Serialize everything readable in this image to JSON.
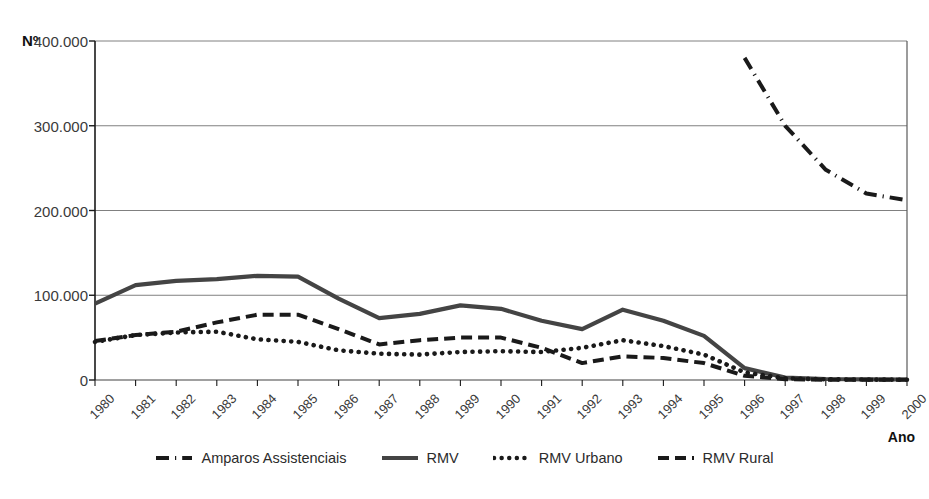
{
  "chart_data": {
    "type": "line",
    "title": "",
    "xlabel": "Ano",
    "ylabel": "Nº",
    "ylim": [
      0,
      400000
    ],
    "yticks": [
      0,
      100000,
      200000,
      300000,
      400000
    ],
    "ytick_labels": [
      "0",
      "100.000",
      "200.000",
      "300.000",
      "400.000"
    ],
    "grid": true,
    "legend_position": "bottom",
    "categories": [
      "1980",
      "1981",
      "1982",
      "1983",
      "1984",
      "1985",
      "1986",
      "1987",
      "1988",
      "1989",
      "1990",
      "1991",
      "1992",
      "1993",
      "1994",
      "1995",
      "1996",
      "1997",
      "1998",
      "1999",
      "2000"
    ],
    "series": [
      {
        "name": "Amparos Assistenciais",
        "style": "dash-dot",
        "color": "#1a1a1a",
        "values": [
          null,
          null,
          null,
          null,
          null,
          null,
          null,
          null,
          null,
          null,
          null,
          null,
          null,
          null,
          null,
          null,
          380000,
          300000,
          248000,
          220000,
          212000
        ]
      },
      {
        "name": "RMV",
        "style": "solid",
        "color": "#444444",
        "values": [
          90000,
          112000,
          117000,
          119000,
          123000,
          122000,
          96000,
          73000,
          78000,
          88000,
          84000,
          70000,
          60000,
          83000,
          70000,
          52000,
          14000,
          3000,
          1200,
          800,
          600
        ]
      },
      {
        "name": "RMV Urbano",
        "style": "dotted",
        "color": "#1a1a1a",
        "values": [
          45000,
          53000,
          56000,
          57000,
          48000,
          45000,
          35000,
          31000,
          30000,
          33000,
          34000,
          33000,
          38000,
          47000,
          40000,
          30000,
          9000,
          2000,
          800,
          500,
          400
        ]
      },
      {
        "name": "RMV Rural",
        "style": "dashed",
        "color": "#1a1a1a",
        "values": [
          46000,
          53000,
          57000,
          68000,
          77000,
          77000,
          60000,
          42000,
          47000,
          50000,
          50000,
          38000,
          20000,
          28000,
          26000,
          20000,
          5000,
          1000,
          400,
          300,
          200
        ]
      }
    ]
  },
  "axis": {
    "y_unit_prefix": "Nº",
    "x_title": "Ano"
  },
  "caption": {
    "text": ""
  }
}
